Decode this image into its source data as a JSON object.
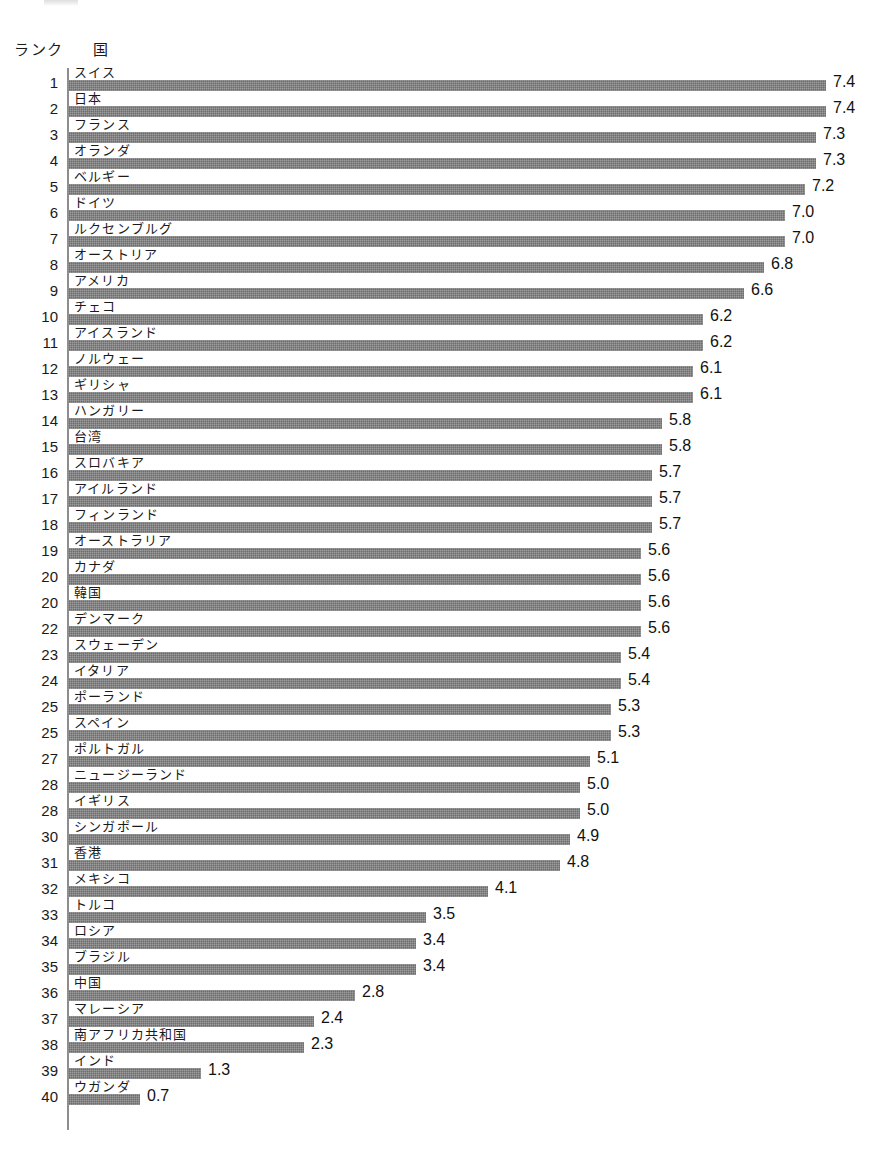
{
  "header": {
    "rank_label": "ランク",
    "country_label": "国"
  },
  "chart_data": {
    "type": "bar",
    "orientation": "horizontal",
    "title": "",
    "subtitle": "",
    "xlabel": "",
    "ylabel": "",
    "xlim": [
      0,
      7.8
    ],
    "grid": false,
    "legend": false,
    "bar_color": "#6d6d6d",
    "background_color": "#ffffff",
    "value_format": "one-decimal",
    "columns": [
      "ランク",
      "国",
      "値"
    ],
    "categories": [
      "スイス",
      "日本",
      "フランス",
      "オランダ",
      "ベルギー",
      "ドイツ",
      "ルクセンブルグ",
      "オーストリア",
      "アメリカ",
      "チェコ",
      "アイスランド",
      "ノルウェー",
      "ギリシャ",
      "ハンガリー",
      "台湾",
      "スロバキア",
      "アイルランド",
      "フィンランド",
      "オーストラリア",
      "カナダ",
      "韓国",
      "デンマーク",
      "スウェーデン",
      "イタリア",
      "ポーランド",
      "スペイン",
      "ポルトガル",
      "ニュージーランド",
      "イギリス",
      "シンガポール",
      "香港",
      "メキシコ",
      "トルコ",
      "ロシア",
      "ブラジル",
      "中国",
      "マレーシア",
      "南アフリカ共和国",
      "インド",
      "ウガンダ"
    ],
    "values": [
      7.4,
      7.4,
      7.3,
      7.3,
      7.2,
      7.0,
      7.0,
      6.8,
      6.6,
      6.2,
      6.2,
      6.1,
      6.1,
      5.8,
      5.8,
      5.7,
      5.7,
      5.7,
      5.6,
      5.6,
      5.6,
      5.6,
      5.4,
      5.4,
      5.3,
      5.3,
      5.1,
      5.0,
      5.0,
      4.9,
      4.8,
      4.1,
      3.5,
      3.4,
      3.4,
      2.8,
      2.4,
      2.3,
      1.3,
      0.7
    ],
    "ranks": [
      "1",
      "2",
      "3",
      "4",
      "5",
      "6",
      "7",
      "8",
      "9",
      "10",
      "11",
      "12",
      "13",
      "14",
      "15",
      "16",
      "17",
      "18",
      "19",
      "20",
      "20",
      "22",
      "23",
      "24",
      "25",
      "25",
      "27",
      "28",
      "28",
      "30",
      "31",
      "32",
      "33",
      "34",
      "35",
      "36",
      "37",
      "38",
      "39",
      "40"
    ],
    "rows": [
      {
        "rank": "1",
        "country": "スイス",
        "value": "7.4"
      },
      {
        "rank": "2",
        "country": "日本",
        "value": "7.4"
      },
      {
        "rank": "3",
        "country": "フランス",
        "value": "7.3"
      },
      {
        "rank": "4",
        "country": "オランダ",
        "value": "7.3"
      },
      {
        "rank": "5",
        "country": "ベルギー",
        "value": "7.2"
      },
      {
        "rank": "6",
        "country": "ドイツ",
        "value": "7.0"
      },
      {
        "rank": "7",
        "country": "ルクセンブルグ",
        "value": "7.0"
      },
      {
        "rank": "8",
        "country": "オーストリア",
        "value": "6.8"
      },
      {
        "rank": "9",
        "country": "アメリカ",
        "value": "6.6"
      },
      {
        "rank": "10",
        "country": "チェコ",
        "value": "6.2"
      },
      {
        "rank": "11",
        "country": "アイスランド",
        "value": "6.2"
      },
      {
        "rank": "12",
        "country": "ノルウェー",
        "value": "6.1"
      },
      {
        "rank": "13",
        "country": "ギリシャ",
        "value": "6.1"
      },
      {
        "rank": "14",
        "country": "ハンガリー",
        "value": "5.8"
      },
      {
        "rank": "15",
        "country": "台湾",
        "value": "5.8"
      },
      {
        "rank": "16",
        "country": "スロバキア",
        "value": "5.7"
      },
      {
        "rank": "17",
        "country": "アイルランド",
        "value": "5.7"
      },
      {
        "rank": "18",
        "country": "フィンランド",
        "value": "5.7"
      },
      {
        "rank": "19",
        "country": "オーストラリア",
        "value": "5.6"
      },
      {
        "rank": "20",
        "country": "カナダ",
        "value": "5.6"
      },
      {
        "rank": "20",
        "country": "韓国",
        "value": "5.6"
      },
      {
        "rank": "22",
        "country": "デンマーク",
        "value": "5.6"
      },
      {
        "rank": "23",
        "country": "スウェーデン",
        "value": "5.4"
      },
      {
        "rank": "24",
        "country": "イタリア",
        "value": "5.4"
      },
      {
        "rank": "25",
        "country": "ポーランド",
        "value": "5.3"
      },
      {
        "rank": "25",
        "country": "スペイン",
        "value": "5.3"
      },
      {
        "rank": "27",
        "country": "ポルトガル",
        "value": "5.1"
      },
      {
        "rank": "28",
        "country": "ニュージーランド",
        "value": "5.0"
      },
      {
        "rank": "28",
        "country": "イギリス",
        "value": "5.0"
      },
      {
        "rank": "30",
        "country": "シンガポール",
        "value": "4.9"
      },
      {
        "rank": "31",
        "country": "香港",
        "value": "4.8"
      },
      {
        "rank": "32",
        "country": "メキシコ",
        "value": "4.1"
      },
      {
        "rank": "33",
        "country": "トルコ",
        "value": "3.5"
      },
      {
        "rank": "34",
        "country": "ロシア",
        "value": "3.4"
      },
      {
        "rank": "35",
        "country": "ブラジル",
        "value": "3.4"
      },
      {
        "rank": "36",
        "country": "中国",
        "value": "2.8"
      },
      {
        "rank": "37",
        "country": "マレーシア",
        "value": "2.4"
      },
      {
        "rank": "38",
        "country": "南アフリカ共和国",
        "value": "2.3"
      },
      {
        "rank": "39",
        "country": "インド",
        "value": "1.3"
      },
      {
        "rank": "40",
        "country": "ウガンダ",
        "value": "0.7"
      }
    ]
  },
  "layout": {
    "row_pitch_px": 26,
    "bar_origin_x_px": 68,
    "px_per_unit": 102.4,
    "bar_height_px": 11
  }
}
